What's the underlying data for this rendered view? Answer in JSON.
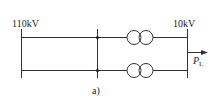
{
  "diagram": {
    "type": "single-line power system diagram",
    "left_bus": {
      "label": "110kV"
    },
    "right_bus": {
      "label": "10kV"
    },
    "branches": [
      {
        "name": "upper",
        "element": "two-winding transformer"
      },
      {
        "name": "lower",
        "element": "two-winding transformer"
      }
    ],
    "load": {
      "symbol": "P",
      "subscript": "L"
    },
    "caption": "a)",
    "colors": {
      "line": "#333333",
      "background": "#ffffff"
    }
  }
}
